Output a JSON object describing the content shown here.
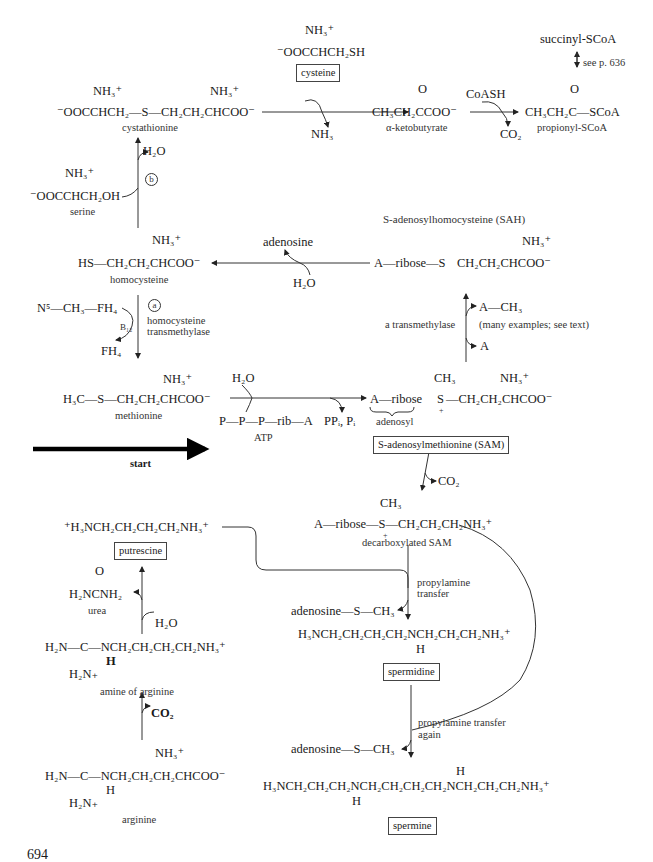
{
  "figure": {
    "page_number": "694",
    "start_label": "start",
    "colors": {
      "ink": "#1a1a1a",
      "background": "#ffffff"
    }
  },
  "compounds": {
    "cystathionine": {
      "name": "cystathionine",
      "formula": "⁻OOCCHCH₂—S—CH₂CH₂CHCOO⁻",
      "amine_left": "NH₃⁺",
      "amine_right": "NH₃⁺"
    },
    "cysteine": {
      "name": "cysteine",
      "formula": "⁻OOCCHCH₂SH",
      "amine": "NH₃⁺"
    },
    "alpha_ketobutyrate": {
      "name": "α-ketobutyrate",
      "formula": "CH₃CH₂CCOO⁻",
      "carbonyl": "O"
    },
    "propionyl_scoa": {
      "name": "propionyl-SCoA",
      "formula": "CH₃CH₂C—SCoA",
      "carbonyl": "O"
    },
    "succinyl_scoa": {
      "name": "succinyl-SCoA"
    },
    "serine": {
      "name": "serine",
      "formula": "⁻OOCCHCH₂OH",
      "amine": "NH₃⁺"
    },
    "homocysteine": {
      "name": "homocysteine",
      "formula": "HS—CH₂CH₂CHCOO⁻",
      "amine": "NH₃⁺"
    },
    "sah": {
      "name": "S-adenosylhomocysteine (SAH)",
      "formula_left": "A—ribose—S",
      "formula_right": "CH₂CH₂CHCOO⁻",
      "amine": "NH₃⁺"
    },
    "methionine": {
      "name": "methionine",
      "formula": "H₃C—S—CH₂CH₂CHCOO⁻",
      "amine": "NH₃⁺"
    },
    "atp": {
      "name": "ATP",
      "formula": "P—P—P—rib—A"
    },
    "sam": {
      "name": "S-adenosylmethionine (SAM)",
      "formula_left": "A—ribose",
      "formula_s": "S",
      "formula_right": "—CH₂CH₂CHCOO⁻",
      "methyl": "CH₃",
      "amine": "NH₃⁺",
      "adenosyl_label": "adenosyl",
      "charge": "+"
    },
    "decarboxylated_sam": {
      "name": "decarboxylated SAM",
      "formula": "A—ribose—S—CH₂CH₂CH₂NH₃⁺",
      "methyl": "CH₃",
      "charge": "+"
    },
    "putrescine": {
      "name": "putrescine",
      "formula": "⁺H₃NCH₂CH₂CH₂CH₂NH₃⁺"
    },
    "urea": {
      "name": "urea",
      "formula": "H₂NCNH₂",
      "carbonyl": "O"
    },
    "amine_of_arginine": {
      "name": "amine of arginine",
      "formula": "H₂N—C—NCH₂CH₂CH₂CH₂NH₃⁺",
      "nh": "H",
      "imine": "H₂N₊"
    },
    "arginine": {
      "name": "arginine",
      "formula": "H₂N—C—NCH₂CH₂CH₂CHCOO⁻",
      "nh": "H",
      "imine": "H₂N₊",
      "amine": "NH₃⁺"
    },
    "spermidine": {
      "name": "spermidine",
      "formula": "H₃NCH₂CH₂CH₂CH₂NCH₂CH₂CH₂NH₃⁺",
      "nh": "H"
    },
    "spermine": {
      "name": "spermine",
      "formula": "H₃NCH₂CH₂CH₂NCH₂CH₂CH₂CH₂NCH₂CH₂CH₂NH₃⁺",
      "nh_top": "H",
      "nh_bottom": "H"
    }
  },
  "reagents": {
    "nh3_out": "NH₃",
    "coash": "CoASH",
    "co2_out_top": "CO₂",
    "see_page": "see p. 636",
    "h2o_out_b": "H₂O",
    "step_b": "b",
    "adenosine_out": "adenosine",
    "h2o_in_sah": "H₂O",
    "n5_methyl_fh4": "N⁵—CH₃—FH₄",
    "b12": "B₁₂",
    "fh4": "FH₄",
    "step_a": "a",
    "homocysteine_transmethylase": [
      "homocysteine",
      "transmethylase"
    ],
    "transmethylase": "a transmethylase",
    "a_ch3": "A—CH₃",
    "many_examples": "(many examples; see text)",
    "a_acceptor": "A",
    "h2o_in_sam": "H₂O",
    "ppi_pi": "PPᵢ, Pᵢ",
    "co2_sam": "CO₂",
    "h2o_in_arginase": "H₂O",
    "co2_arginine": "CO₂",
    "propylamine_transfer": [
      "propylamine",
      "transfer"
    ],
    "mta_1": "adenosine—S—CH₃",
    "propylamine_transfer_again": [
      "propylamine transfer",
      "again"
    ],
    "mta_2": "adenosine—S—CH₃"
  }
}
